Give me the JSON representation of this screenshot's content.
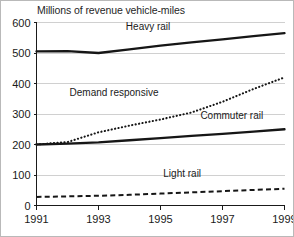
{
  "chart_data": {
    "type": "line",
    "title": "Millions of revenue vehicle-miles",
    "xlabel": "",
    "ylabel": "",
    "xlim": [
      1991,
      1999
    ],
    "ylim": [
      0,
      600
    ],
    "grid": true,
    "legend_position": "inline-labels",
    "x": [
      1991,
      1992,
      1993,
      1994,
      1995,
      1996,
      1997,
      1998,
      1999
    ],
    "xticks": [
      1991,
      1993,
      1995,
      1997,
      1999
    ],
    "xtick_labels": [
      "1991",
      "1993",
      "1995",
      "1997",
      "1999"
    ],
    "yticks": [
      0,
      100,
      200,
      300,
      400,
      500,
      600
    ],
    "ytick_labels": [
      "0",
      "100",
      "200",
      "300",
      "400",
      "500",
      "600"
    ],
    "series": [
      {
        "name": "Heavy rail",
        "style": "solid",
        "color": "#161616",
        "values": [
          505,
          506,
          500,
          512,
          524,
          535,
          545,
          555,
          565
        ],
        "label_x": 1994.6,
        "label_y": 575
      },
      {
        "name": "Demand responsive",
        "style": "dotted",
        "color": "#161616",
        "values": [
          200,
          208,
          240,
          262,
          282,
          305,
          340,
          382,
          420
        ],
        "label_x": 1993.5,
        "label_y": 358
      },
      {
        "name": "Commuter rail",
        "style": "solid",
        "color": "#161616",
        "values": [
          200,
          203,
          207,
          214,
          221,
          228,
          235,
          242,
          250
        ],
        "label_x": 1997.3,
        "label_y": 282
      },
      {
        "name": "Light rail",
        "style": "dashed",
        "color": "#161616",
        "values": [
          28,
          30,
          32,
          35,
          39,
          43,
          47,
          51,
          55
        ],
        "label_x": 1995.7,
        "label_y": 92
      }
    ]
  }
}
